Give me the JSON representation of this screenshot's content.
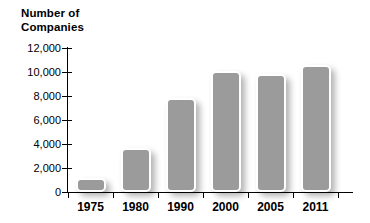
{
  "chart_data": {
    "type": "bar",
    "title": "Number of\nCompanies",
    "xlabel": "",
    "ylabel": "Number of Companies",
    "categories": [
      "1975",
      "1980",
      "1990",
      "2000",
      "2005",
      "2011"
    ],
    "values": [
      1200,
      3700,
      7800,
      10100,
      9800,
      10600
    ],
    "ylim": [
      0,
      12000
    ],
    "yticks": [
      0,
      2000,
      4000,
      6000,
      8000,
      10000,
      12000
    ],
    "ytick_labels": [
      "0",
      "2,000",
      "4,000",
      "6,000",
      "8,000",
      "10,000",
      "12,000"
    ],
    "grid": false,
    "legend": false,
    "series": [
      {
        "name": "Number of Companies",
        "values": [
          1200,
          3700,
          7800,
          10100,
          9800,
          10600
        ]
      }
    ],
    "colors": {
      "bar_fill": "#9b9b9b",
      "bar_border": "#ffffff",
      "axis": "#000000",
      "text": "#000000",
      "background": "#ffffff"
    }
  }
}
